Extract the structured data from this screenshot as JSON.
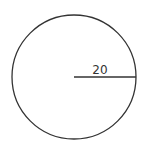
{
  "diagram": {
    "shape": "circle",
    "radius_label": "20",
    "stroke_color": "#333333",
    "background": "#ffffff"
  }
}
